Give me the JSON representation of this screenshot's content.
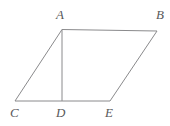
{
  "figure": {
    "name": "parallelogram-with-altitude",
    "background_color": "#ffffff",
    "stroke_color": "#8a8a8c",
    "label_color": "#58585a",
    "stroke_width": 1,
    "width": 170,
    "height": 126,
    "points": {
      "A": {
        "label": "A",
        "x": 62,
        "y": 30
      },
      "B": {
        "label": "B",
        "x": 157,
        "y": 31
      },
      "C": {
        "label": "C",
        "x": 15,
        "y": 101
      },
      "D": {
        "label": "D",
        "x": 62,
        "y": 101
      },
      "E": {
        "label": "E",
        "x": 110,
        "y": 101
      }
    },
    "segments": [
      {
        "name": "segment-AB",
        "from": "A",
        "to": "B"
      },
      {
        "name": "segment-BE",
        "from": "B",
        "to": "E"
      },
      {
        "name": "segment-CE",
        "from": "C",
        "to": "E"
      },
      {
        "name": "segment-CA",
        "from": "C",
        "to": "A"
      },
      {
        "name": "segment-AD",
        "from": "A",
        "to": "D"
      }
    ]
  }
}
